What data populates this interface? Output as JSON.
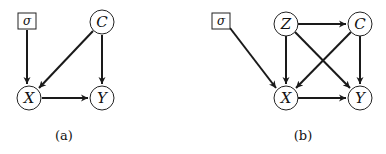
{
  "panels": [
    {
      "caption": "(a)",
      "nodes": {
        "sigma": "σ",
        "C": "C",
        "X": "X",
        "Y": "Y"
      },
      "edges": [
        [
          "σ",
          "X"
        ],
        [
          "C",
          "X"
        ],
        [
          "C",
          "Y"
        ],
        [
          "X",
          "Y"
        ]
      ]
    },
    {
      "caption": "(b)",
      "nodes": {
        "sigma": "σ",
        "Z": "Z",
        "C": "C",
        "X": "X",
        "Y": "Y"
      },
      "edges": [
        [
          "σ",
          "X"
        ],
        [
          "Z",
          "C"
        ],
        [
          "Z",
          "X"
        ],
        [
          "Z",
          "Y"
        ],
        [
          "C",
          "X"
        ],
        [
          "C",
          "Y"
        ],
        [
          "X",
          "Y"
        ]
      ]
    }
  ]
}
